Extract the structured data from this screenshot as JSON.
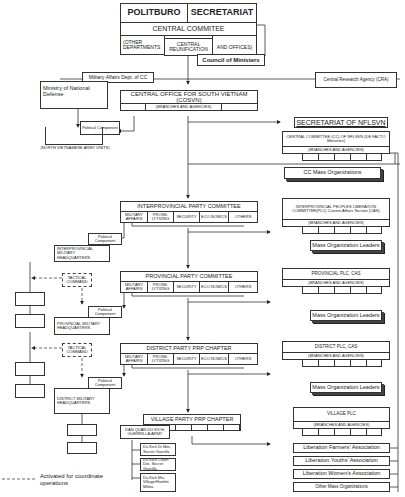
{
  "top": {
    "politburo": "POLITBURO",
    "secretariat": "SECRETARIAT",
    "central_committee": "CENTRAL COMMITEE",
    "other_departments": "(OTHER DEPARTMENTS",
    "central_reunification": "CENTRAL REUNIFICATION",
    "and_offices": "AND OFFICES)",
    "council_of_ministers": "Council of Ministers"
  },
  "side": {
    "military_affairs_dept": "Military Affairs Dept. of CC",
    "ministry_defense": "Ministry of National Defense",
    "central_research_agency": "Central Research Agency (CRA)",
    "political_component": "Political Component",
    "nva_units": "(NORTH VIETNAMESE ARMY UNITS)"
  },
  "cosvn": {
    "title": "CENTRAL OFFICE FOR SOUTH VIETNAM (COSVN)",
    "branches": "(BRANCHES AND AGENCIES)"
  },
  "nflsvn": {
    "secretariat": "SECRETARIAT OF NFLSVN",
    "central_committee": "CENTRAL COMMITTEE (CC) OF NFLSVN (DE FACTO Ministries)",
    "branches": "(BRANCHES AND AGENCIES)",
    "cc_mass_orgs": "CC Mass Organizations"
  },
  "party_levels": [
    {
      "title": "INTERPROVINCIAL PARTY COMMITTEE"
    },
    {
      "title": "PROVINCIAL PARTY COMMITTEE"
    },
    {
      "title": "DISTRICT PARTY PRP CHAPTER"
    },
    {
      "title": "VILLAGE PARTY PRP CHAPTER"
    }
  ],
  "sections": {
    "military_affairs": "MILITARY AFFAIRS",
    "proselytizing": "PROSE-LYTIZING",
    "security": "SECURITY",
    "economics": "ECO-NOMICS",
    "others": "OTHERS"
  },
  "military": {
    "interprovincial_hq": "INTERPROVINCIAL MILITARY HEADQUARTERS",
    "provincial_hq": "PROVINCIAL MILITARY HEADQUARTERS",
    "district_hq": "DISTRICT MILITARY HEADQUARTERS",
    "tactical_command": "TACTICAL COMMAND",
    "political_component": "Political Component"
  },
  "plc": {
    "interprovincial": "INTERPROVINCIAL PEOPLES LIBERATION COMMITTEE(PLC) Current Affairs Section (CAS)",
    "provincial": "PROVINCIAL PLC, CAS",
    "district": "DISTRICT PLC, CAS",
    "village": "VILLAGE PLC",
    "branches": "(BRANCHES AND AGENCIES)",
    "mass_org_leaders": "Mass Organization Leaders"
  },
  "village": {
    "dan_quan": "DAN QUAN DU KICH, GUERRILLA ARMY",
    "secret_guerilla_1": "Du Kich Di Mot, Secret Guerilla",
    "secret_guerilla_2": "Du Kich Chien Dot, Secret Guerilla",
    "hamlet_militia": "Du Kich Mo, Village/Hamlet Militia"
  },
  "associations": [
    "Liberation Farmers' Association",
    "Liberation Youths' Association",
    "Liberation Women's Association",
    "Other Mass Organizations"
  ],
  "legend": {
    "dashed_label": "Activated for coordinate operations"
  }
}
